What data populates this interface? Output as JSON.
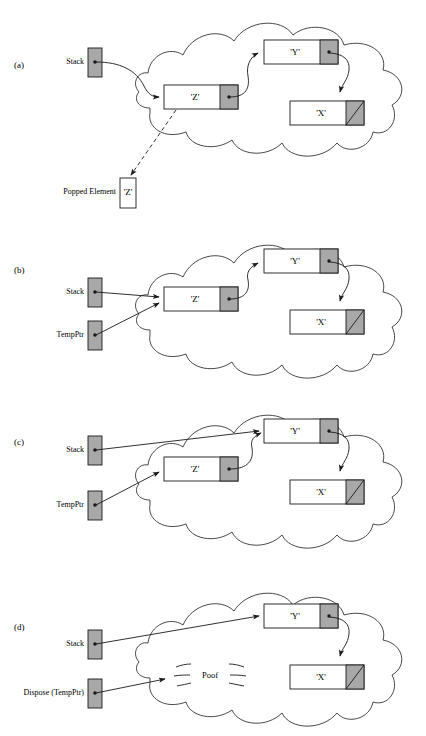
{
  "figure": {
    "colors": {
      "stroke": "#1a1a1a",
      "gray_fill": "#a8a8a8",
      "white_fill": "#ffffff",
      "background": "#ffffff"
    }
  },
  "panels": [
    {
      "id": "a",
      "label": "(a)",
      "pointers": [
        {
          "name": "stack-pointer",
          "label": "Stack",
          "target": "node-Z"
        }
      ],
      "nodes": [
        {
          "name": "node-Z",
          "label": "'Z'",
          "next": "node-Y",
          "null_next": false
        },
        {
          "name": "node-Y",
          "label": "'Y'",
          "next": "node-X",
          "null_next": false
        },
        {
          "name": "node-X",
          "label": "'X'",
          "next": null,
          "null_next": true
        }
      ],
      "extra": {
        "popped_label": "Popped Element",
        "popped_value": "'Z'"
      }
    },
    {
      "id": "b",
      "label": "(b)",
      "pointers": [
        {
          "name": "stack-pointer",
          "label": "Stack",
          "target": "node-Z"
        },
        {
          "name": "tempptr-pointer",
          "label": "TempPtr",
          "target": "node-Z"
        }
      ],
      "nodes": [
        {
          "name": "node-Z",
          "label": "'Z'",
          "next": "node-Y",
          "null_next": false
        },
        {
          "name": "node-Y",
          "label": "'Y'",
          "next": "node-X",
          "null_next": false
        },
        {
          "name": "node-X",
          "label": "'X'",
          "next": null,
          "null_next": true
        }
      ]
    },
    {
      "id": "c",
      "label": "(c)",
      "pointers": [
        {
          "name": "stack-pointer",
          "label": "Stack",
          "target": "node-Y"
        },
        {
          "name": "tempptr-pointer",
          "label": "TempPtr",
          "target": "node-Z"
        }
      ],
      "nodes": [
        {
          "name": "node-Z",
          "label": "'Z'",
          "next": "node-Y",
          "null_next": false
        },
        {
          "name": "node-Y",
          "label": "'Y'",
          "next": "node-X",
          "null_next": false
        },
        {
          "name": "node-X",
          "label": "'X'",
          "next": null,
          "null_next": true
        }
      ]
    },
    {
      "id": "d",
      "label": "(d)",
      "pointers": [
        {
          "name": "stack-pointer",
          "label": "Stack",
          "target": "node-Y"
        },
        {
          "name": "dispose-pointer",
          "label": "Dispose (TempPtr)",
          "target": "poof"
        }
      ],
      "nodes": [
        {
          "name": "node-Y",
          "label": "'Y'",
          "next": "node-X",
          "null_next": false
        },
        {
          "name": "node-X",
          "label": "'X'",
          "next": null,
          "null_next": true
        }
      ],
      "extra": {
        "poof_label": "Poof"
      }
    }
  ]
}
